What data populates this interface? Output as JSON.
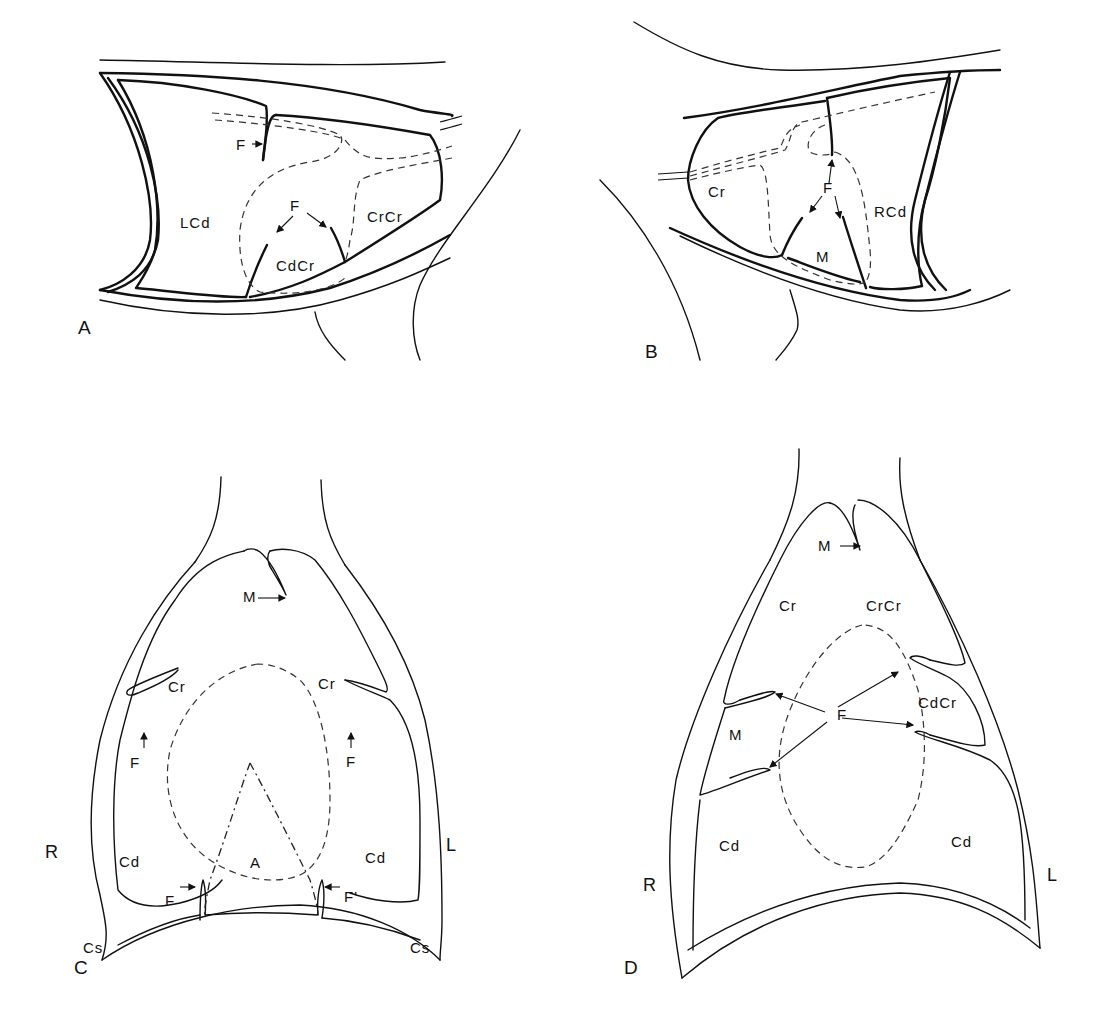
{
  "figure": {
    "panels": [
      {
        "id": "A",
        "letter": "A",
        "labels": {
          "f_top": "F",
          "lcd": "LCd",
          "f_mid": "F",
          "crcr": "CrCr",
          "cdcr": "CdCr"
        }
      },
      {
        "id": "B",
        "letter": "B",
        "labels": {
          "cr": "Cr",
          "f": "F",
          "rcd": "RCd",
          "m": "M"
        }
      },
      {
        "id": "C",
        "letter": "C",
        "labels": {
          "m": "M",
          "cr_left": "Cr",
          "cr_right": "Cr",
          "f_left": "F",
          "f_right": "F",
          "cd_left": "Cd",
          "cd_right": "Cd",
          "a": "A",
          "f_bottom_left": "F",
          "f_prime": "F'",
          "cs_left": "Cs",
          "cs_right": "Cs",
          "side_r": "R",
          "side_l": "L"
        }
      },
      {
        "id": "D",
        "letter": "D",
        "labels": {
          "m_top": "M",
          "cr": "Cr",
          "crcr": "CrCr",
          "f": "F",
          "cdcr": "CdCr",
          "m_left": "M",
          "cd_left": "Cd",
          "cd_right": "Cd",
          "side_r": "R",
          "side_l": "L"
        }
      }
    ],
    "line_styles": {
      "outline": "#111111",
      "dashed_projection": "#333333",
      "background": "#ffffff"
    }
  }
}
